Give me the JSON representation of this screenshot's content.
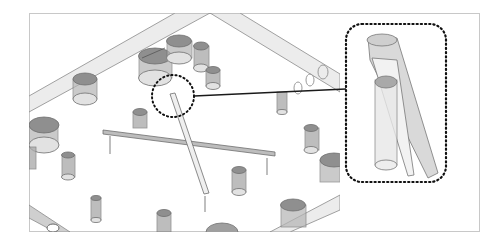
{
  "figure": {
    "type": "isometric technical illustration",
    "frame": {
      "x": 29,
      "y": 13,
      "w": 450,
      "h": 219,
      "stroke": "#c8c8c8"
    },
    "colors": {
      "background": "#ffffff",
      "outline": "#6e6e6e",
      "cylinder_fill": "#9a9a9a",
      "cylinder_light": "#dcdcdc",
      "bar_fill": "#e6e6e6",
      "leader_line": "#1a1a1a",
      "dots": "#111111"
    },
    "callout": {
      "source_circle": {
        "cx": 173,
        "cy": 96,
        "r": 21
      },
      "leader": {
        "x1": 194,
        "y1": 96,
        "x2": 346,
        "y2": 89
      },
      "detail_box": {
        "x": 346,
        "y": 24,
        "w": 100,
        "h": 158,
        "rx": 16
      }
    }
  }
}
